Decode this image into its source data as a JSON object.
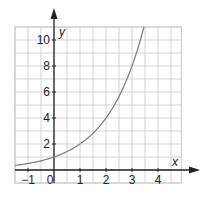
{
  "chart_data": {
    "type": "line",
    "title": "",
    "xlabel": "x",
    "ylabel": "y",
    "function": "y = 2^x",
    "xlim": [
      -1.5,
      4.9
    ],
    "ylim": [
      -1,
      11
    ],
    "grid": true,
    "grid_step": {
      "x": 0.5,
      "y": 1
    },
    "x_ticks": [
      {
        "value": -1,
        "label": "−1"
      },
      {
        "value": 0,
        "label": "0"
      },
      {
        "value": 1,
        "label": "1"
      },
      {
        "value": 2,
        "label": "2"
      },
      {
        "value": 3,
        "label": "3"
      },
      {
        "value": 4,
        "label": "4"
      }
    ],
    "y_ticks": [
      {
        "value": 2,
        "label": "2"
      },
      {
        "value": 4,
        "label": "4"
      },
      {
        "value": 6,
        "label": "6"
      },
      {
        "value": 8,
        "label": "8"
      },
      {
        "value": 10,
        "label": "10"
      }
    ],
    "series": [
      {
        "name": "y = 2^x",
        "x": [
          -1.5,
          -1,
          0,
          1,
          2,
          3,
          3.4
        ],
        "y": [
          0.35,
          0.5,
          1,
          2,
          4,
          8,
          10.6
        ]
      }
    ],
    "legend": "none"
  },
  "colors": {
    "grid": "#c8c8c8",
    "axis": "#222222",
    "curve": "#7a7a7a"
  },
  "labels": {
    "x_axis": "x",
    "y_axis": "y"
  }
}
